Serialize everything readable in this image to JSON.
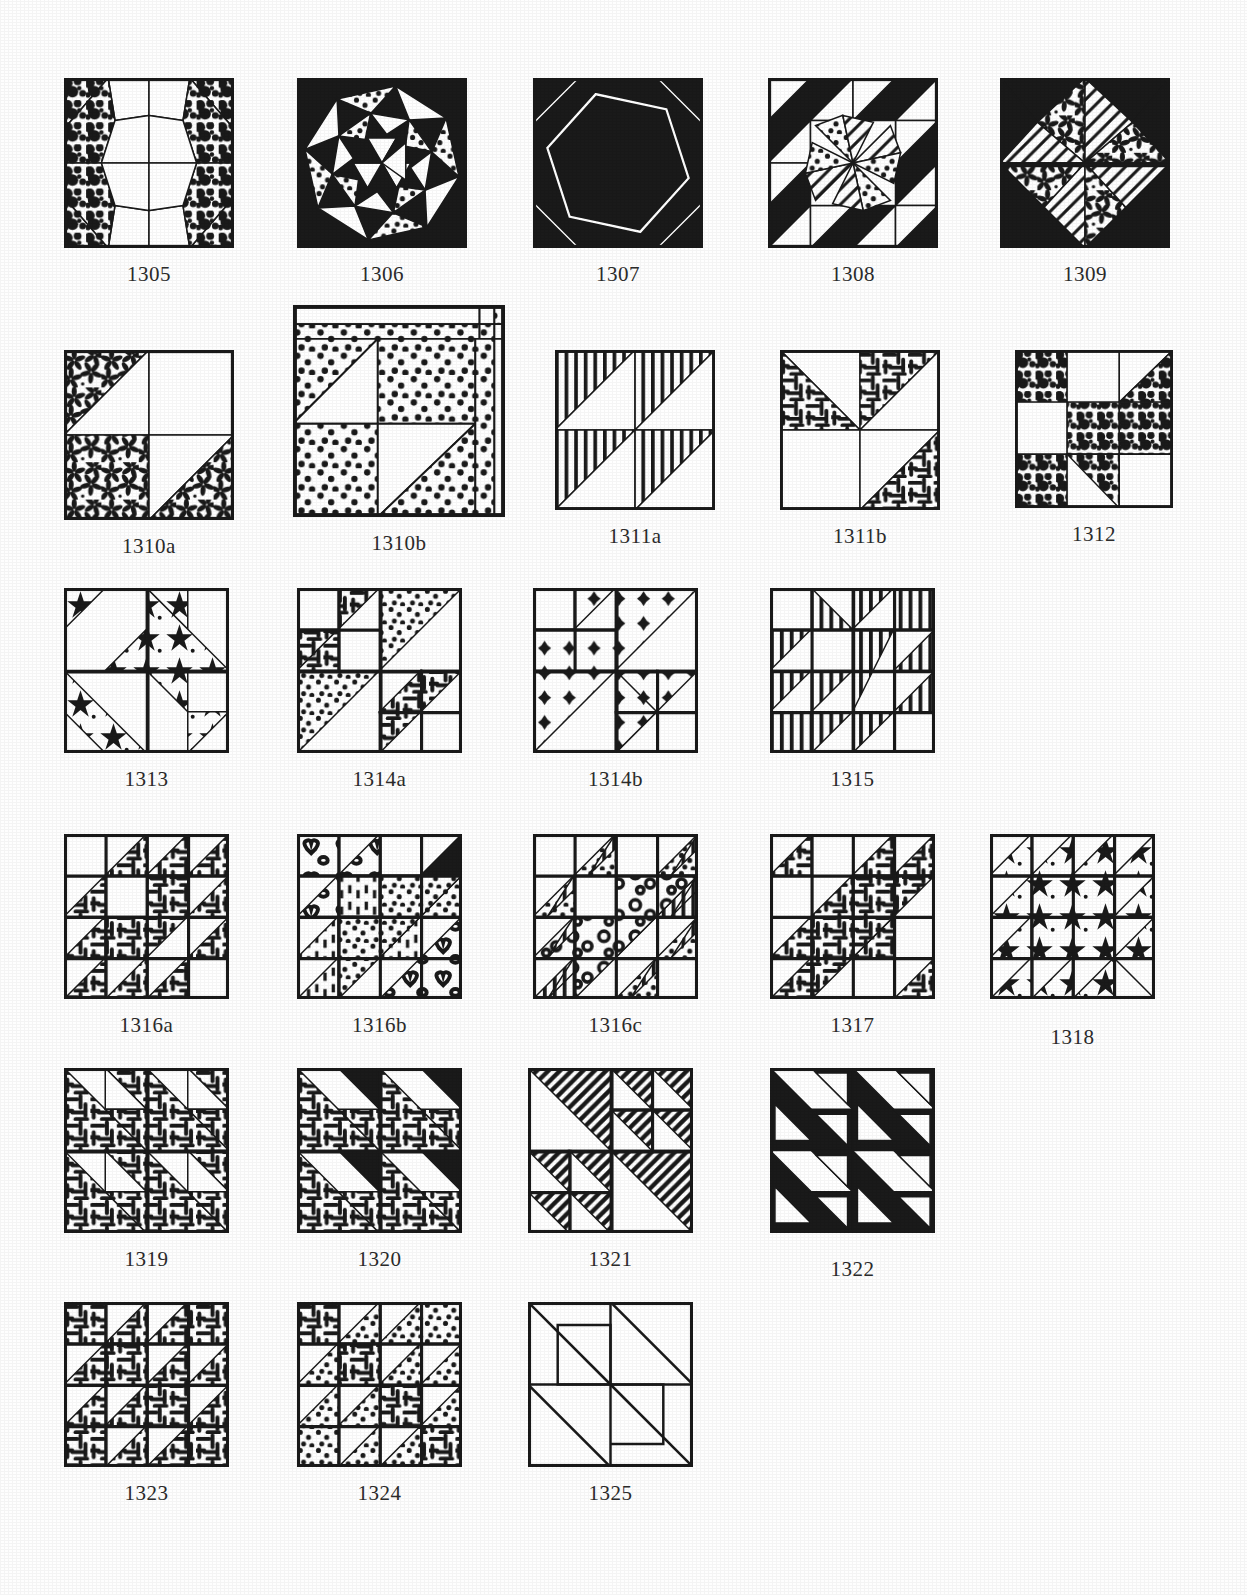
{
  "page": {
    "kind": "quilt-block-pattern-plate",
    "background": "#fefefe",
    "ink": "#1a1a1a",
    "block_size_px": 170,
    "rows": [
      {
        "name": "row-1",
        "top": 78,
        "caption_offset": 14,
        "blocks": [
          {
            "id": "1305",
            "label": "1305",
            "x": 64,
            "size": 170,
            "design": "d1305",
            "fills": [
              "speckle",
              "white"
            ]
          },
          {
            "id": "1306",
            "label": "1306",
            "x": 297,
            "size": 170,
            "design": "d1306",
            "fills": [
              "solid",
              "dots",
              "white",
              "hatch"
            ]
          },
          {
            "id": "1307",
            "label": "1307",
            "x": 533,
            "size": 170,
            "design": "d1307",
            "fills": [
              "solid",
              "white",
              "hatch"
            ]
          },
          {
            "id": "1308",
            "label": "1308",
            "x": 768,
            "size": 170,
            "design": "d1308",
            "fills": [
              "solid",
              "white",
              "dots",
              "hatch"
            ]
          },
          {
            "id": "1309",
            "label": "1309",
            "x": 1000,
            "size": 170,
            "design": "d1309",
            "fills": [
              "solid",
              "white",
              "floral",
              "hatch"
            ]
          }
        ]
      },
      {
        "name": "row-2",
        "top": 350,
        "caption_offset": 14,
        "blocks": [
          {
            "id": "1310a",
            "label": "1310a",
            "x": 64,
            "size": 170,
            "design": "d1310a",
            "fills": [
              "floral",
              "white"
            ]
          },
          {
            "id": "1310b",
            "label": "1310b",
            "x": 293,
            "size": 212,
            "design": "d1310b",
            "fills": [
              "dots",
              "white"
            ],
            "top_shift": -45
          },
          {
            "id": "1311a",
            "label": "1311a",
            "x": 555,
            "size": 160,
            "design": "d1311a",
            "fills": [
              "vstripe",
              "white"
            ]
          },
          {
            "id": "1311b",
            "label": "1311b",
            "x": 780,
            "size": 160,
            "design": "d1311b",
            "fills": [
              "weave",
              "white"
            ]
          },
          {
            "id": "1312",
            "label": "1312",
            "x": 1015,
            "size": 158,
            "design": "d1312",
            "fills": [
              "speckle",
              "white"
            ]
          }
        ]
      },
      {
        "name": "row-3",
        "top": 588,
        "caption_offset": 14,
        "blocks": [
          {
            "id": "1313",
            "label": "1313",
            "x": 64,
            "size": 165,
            "design": "d1313",
            "fills": [
              "stars",
              "white"
            ]
          },
          {
            "id": "1314a",
            "label": "1314a",
            "x": 297,
            "size": 165,
            "design": "d1314a",
            "fills": [
              "dots",
              "weave",
              "white"
            ]
          },
          {
            "id": "1314b",
            "label": "1314b",
            "x": 533,
            "size": 165,
            "design": "d1314b",
            "fills": [
              "plus",
              "white"
            ]
          },
          {
            "id": "1315",
            "label": "1315",
            "x": 770,
            "size": 165,
            "design": "d1315",
            "fills": [
              "vstripe",
              "white"
            ]
          }
        ]
      },
      {
        "name": "row-4",
        "top": 834,
        "caption_offset": 14,
        "blocks": [
          {
            "id": "1316a",
            "label": "1316a",
            "x": 64,
            "size": 165,
            "design": "d1316a",
            "fills": [
              "weave",
              "white"
            ]
          },
          {
            "id": "1316b",
            "label": "1316b",
            "x": 297,
            "size": 165,
            "design": "d1316b",
            "fills": [
              "hearts",
              "dash",
              "dots",
              "white"
            ]
          },
          {
            "id": "1316c",
            "label": "1316c",
            "x": 533,
            "size": 165,
            "design": "d1316c",
            "fills": [
              "rings",
              "dots",
              "vstripe",
              "white"
            ]
          },
          {
            "id": "1317",
            "label": "1317",
            "x": 770,
            "size": 165,
            "design": "d1317",
            "fills": [
              "weave",
              "white"
            ]
          },
          {
            "id": "1318",
            "label": "1318",
            "x": 990,
            "size": 165,
            "design": "d1318",
            "fills": [
              "stars",
              "white"
            ],
            "caption_shift": 12
          }
        ]
      },
      {
        "name": "row-5",
        "top": 1068,
        "caption_offset": 14,
        "blocks": [
          {
            "id": "1319",
            "label": "1319",
            "x": 64,
            "size": 165,
            "design": "d1319",
            "fills": [
              "weave",
              "white"
            ]
          },
          {
            "id": "1320",
            "label": "1320",
            "x": 297,
            "size": 165,
            "design": "d1320",
            "fills": [
              "weave",
              "solid",
              "white"
            ]
          },
          {
            "id": "1321",
            "label": "1321",
            "x": 528,
            "size": 165,
            "design": "d1321",
            "fills": [
              "diag",
              "white"
            ]
          },
          {
            "id": "1322",
            "label": "1322",
            "x": 770,
            "size": 165,
            "design": "d1322",
            "fills": [
              "solid",
              "white"
            ],
            "caption_shift": 10
          }
        ]
      },
      {
        "name": "row-6",
        "top": 1302,
        "caption_offset": 14,
        "blocks": [
          {
            "id": "1323",
            "label": "1323",
            "x": 64,
            "size": 165,
            "design": "d1323",
            "fills": [
              "weave",
              "white"
            ]
          },
          {
            "id": "1324",
            "label": "1324",
            "x": 297,
            "size": 165,
            "design": "d1324",
            "fills": [
              "weave",
              "dots",
              "white"
            ]
          },
          {
            "id": "1325",
            "label": "1325",
            "x": 528,
            "size": 165,
            "design": "d1325",
            "fills": [
              "white"
            ]
          }
        ]
      }
    ]
  }
}
